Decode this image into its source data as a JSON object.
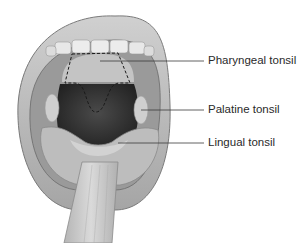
{
  "figure": {
    "labels": [
      {
        "id": "pharyngeal",
        "text": "Pharyngeal tonsil"
      },
      {
        "id": "palatine",
        "text": "Palatine tonsil"
      },
      {
        "id": "lingual",
        "text": "Lingual tonsil"
      }
    ]
  },
  "colors": {
    "background": "#ffffff",
    "lip": "#b8b8b8",
    "lip_dark": "#8a8a8a",
    "teeth": "#e6e6e6",
    "throat": "#3a3a3a",
    "palate": "#c8c8c8",
    "tongue": "#bdbdbd",
    "depressor": "#d2d2d2",
    "leader_line": "#3a3a3a",
    "text": "#2a2a2a"
  }
}
